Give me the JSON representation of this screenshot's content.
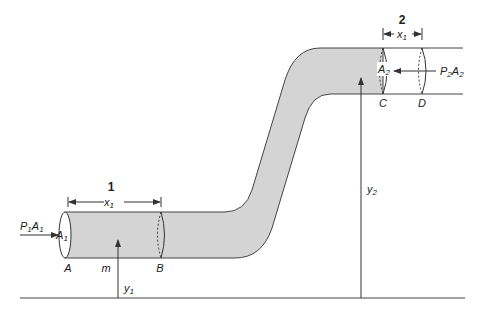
{
  "diagram": {
    "colors": {
      "pipe_fill": "#d4d4d4",
      "stroke": "#333333",
      "background": "#ffffff"
    },
    "section1": {
      "number": "1",
      "length_label": "x",
      "length_sub": "1",
      "force_label": "P",
      "force_sub1": "1",
      "force_label2": "A",
      "force_sub2": "1",
      "area_label": "A",
      "area_sub": "1",
      "point_start": "A",
      "point_end": "B",
      "mass_label": "m",
      "height_label": "y",
      "height_sub": "1"
    },
    "section2": {
      "number": "2",
      "length_label": "x",
      "length_sub": "1",
      "force_label": "P",
      "force_sub1": "2",
      "force_label2": "A",
      "force_sub2": "2",
      "area_label": "A",
      "area_sub": "2",
      "point_start": "C",
      "point_end": "D",
      "height_label": "y",
      "height_sub": "2"
    }
  }
}
